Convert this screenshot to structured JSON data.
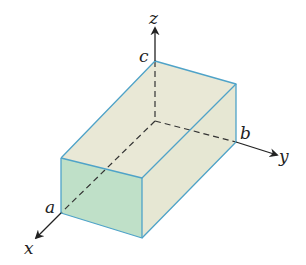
{
  "diagram": {
    "labels": {
      "x_axis": "x",
      "y_axis": "y",
      "z_axis": "z",
      "a": "a",
      "b": "b",
      "c": "c"
    },
    "colors": {
      "front_face": "#bfe0c8",
      "top_face": "#e9e8d6",
      "side_face": "#e6e7d3",
      "back_faces": "#eeeee2",
      "edge": "#4fa3c8",
      "axis": "#222222",
      "dashed": "#333333"
    }
  }
}
